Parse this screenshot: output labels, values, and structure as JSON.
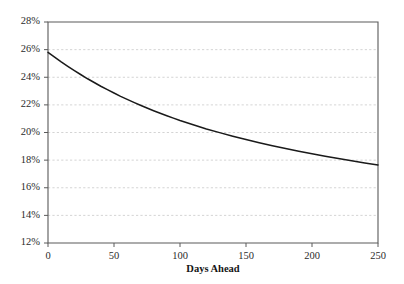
{
  "chart_data": {
    "type": "line",
    "title": "",
    "subtitle": "",
    "xlabel": "Days Ahead",
    "ylabel": "",
    "xlim": [
      0,
      250
    ],
    "ylim": [
      12,
      28
    ],
    "grid": true,
    "grid_axis": "y",
    "grid_style": "dashed",
    "legend": false,
    "legend_position": "none",
    "y_unit": "%",
    "x_tick_labels": [
      "0",
      "50",
      "100",
      "150",
      "200",
      "250"
    ],
    "x_ticks": [
      0,
      50,
      100,
      150,
      200,
      250
    ],
    "y_tick_labels": [
      "12%",
      "14%",
      "16%",
      "18%",
      "20%",
      "22%",
      "24%",
      "26%",
      "28%"
    ],
    "y_ticks": [
      12,
      14,
      16,
      18,
      20,
      22,
      24,
      26,
      28
    ],
    "series": [
      {
        "name": "Implied volatility term structure",
        "color": "#1a1a1a",
        "x": [
          0,
          5,
          10,
          15,
          20,
          25,
          30,
          35,
          40,
          45,
          50,
          55,
          60,
          65,
          70,
          75,
          80,
          85,
          90,
          95,
          100,
          110,
          120,
          130,
          140,
          150,
          160,
          170,
          180,
          190,
          200,
          210,
          220,
          230,
          240,
          250
        ],
        "values": [
          25.8,
          25.45,
          25.11,
          24.79,
          24.48,
          24.18,
          23.89,
          23.62,
          23.35,
          23.1,
          22.86,
          22.62,
          22.4,
          22.18,
          21.97,
          21.77,
          21.58,
          21.39,
          21.21,
          21.04,
          20.87,
          20.56,
          20.26,
          19.99,
          19.73,
          19.49,
          19.26,
          19.04,
          18.84,
          18.64,
          18.46,
          18.28,
          18.11,
          17.95,
          17.8,
          17.65
        ]
      }
    ],
    "annotations": []
  },
  "accent_colors": {
    "series": "#1a1a1a",
    "gridline": "#c9c9c9",
    "axis": "#5a5a5a",
    "text": "#2b2b2b",
    "background": "#ffffff"
  }
}
